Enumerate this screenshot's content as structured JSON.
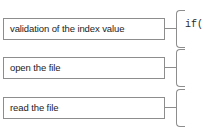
{
  "diagram": {
    "colors": {
      "box_border": "#8d8d8d",
      "text": "#1c1c1c",
      "code_text": "#2a2a2a",
      "background": "#ffffff"
    },
    "steps": [
      {
        "label": "validation of the index value",
        "code": "if("
      },
      {
        "label": "open the file",
        "code": ""
      },
      {
        "label": "read the file",
        "code": ""
      }
    ]
  }
}
